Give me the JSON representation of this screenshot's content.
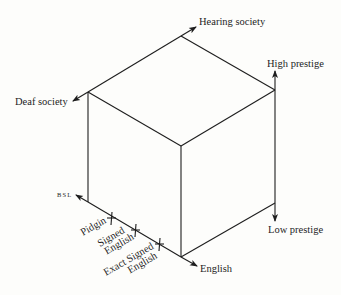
{
  "diagram": {
    "type": "isometric-cube-with-axes",
    "axes": {
      "society": {
        "positive": "Hearing society",
        "negative": "Deaf society"
      },
      "prestige": {
        "positive": "High prestige",
        "negative": "Low prestige"
      },
      "language": {
        "start": "BSL",
        "end": "English",
        "markers": [
          {
            "label_line1": "Pidgin",
            "label_line2": ""
          },
          {
            "label_line1": "Signed",
            "label_line2": "English"
          },
          {
            "label_line1": "Exact Signed",
            "label_line2": "English"
          }
        ]
      }
    },
    "colors": {
      "line": "#1e1e1e",
      "background": "#fdfdfb"
    }
  }
}
